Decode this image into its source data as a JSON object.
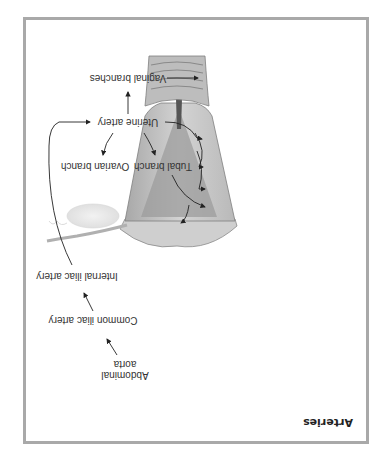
{
  "orientation": "rotated-180",
  "title": "Arteries",
  "labels": {
    "abdominal_aorta": "Abdominal\naorta",
    "abdominal": "Abdominal",
    "aorta": "aorta",
    "common_iliac": "Common iliac artery",
    "internal_iliac": "Internal iliac artery",
    "uterine": "Uterine artery",
    "vaginal": "Vaginal branches",
    "tubal": "Tubal branch",
    "ovarian": "Ovarian branch"
  },
  "colors": {
    "border": "#a9a9a9",
    "text": "#333333",
    "arrow": "#222222",
    "tissue": "#c8c8c8",
    "tissue_dark": "#8e8e8e"
  }
}
